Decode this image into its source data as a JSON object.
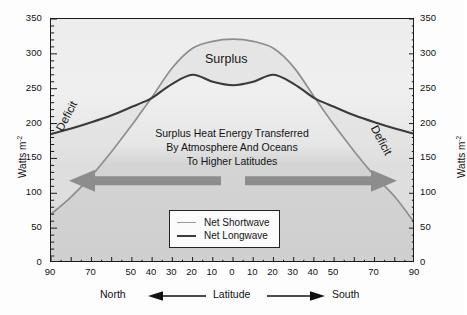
{
  "chart_data": {
    "type": "line",
    "title": "",
    "xlabel": "Latitude",
    "ylabel": "Watts m⁻²",
    "ylabel_right": "Watts m⁻²",
    "ylim": [
      0,
      350
    ],
    "yticks": [
      0,
      50,
      100,
      150,
      200,
      250,
      300,
      350
    ],
    "ytick_labels": [
      "0",
      "50",
      "100",
      "150",
      "200",
      "250",
      "300",
      "350"
    ],
    "ytick_labels_right": [
      "0",
      "50",
      "100",
      "150",
      "200",
      "250",
      "300",
      "350"
    ],
    "xlim": [
      -90,
      90
    ],
    "xticks": [
      -90,
      -70,
      -50,
      -40,
      -30,
      -20,
      -10,
      0,
      10,
      20,
      30,
      40,
      50,
      70,
      90
    ],
    "xtick_labels": [
      "90",
      "70",
      "50",
      "40",
      "30",
      "20",
      "10",
      "0",
      "10",
      "20",
      "30",
      "40",
      "50",
      "70",
      "90"
    ],
    "grid": false,
    "legend_position": "lower-center-right",
    "hemisphere_left": "North",
    "hemisphere_right": "South",
    "series": [
      {
        "name": "Net Shortwave",
        "color": "#8e8e8e",
        "x": [
          -90,
          -80,
          -70,
          -60,
          -50,
          -45,
          -40,
          -30,
          -20,
          -10,
          0,
          10,
          20,
          30,
          40,
          45,
          50,
          60,
          70,
          80,
          90
        ],
        "values": [
          70,
          95,
          125,
          160,
          198,
          218,
          238,
          280,
          308,
          318,
          321,
          318,
          308,
          281,
          239,
          218,
          198,
          160,
          125,
          95,
          57
        ]
      },
      {
        "name": "Net Longwave",
        "color": "#3a3a3a",
        "x": [
          -90,
          -80,
          -70,
          -60,
          -50,
          -45,
          -40,
          -30,
          -20,
          -10,
          0,
          10,
          20,
          30,
          40,
          45,
          50,
          60,
          70,
          80,
          90
        ],
        "values": [
          185,
          193,
          202,
          212,
          224,
          230,
          237,
          257,
          270,
          260,
          255,
          260,
          270,
          257,
          237,
          230,
          224,
          212,
          202,
          193,
          185
        ]
      }
    ],
    "annotations": [
      {
        "name": "surplus",
        "text": "Surplus"
      },
      {
        "name": "deficit-north",
        "text": "Deficit"
      },
      {
        "name": "deficit-south",
        "text": "Deficit"
      },
      {
        "name": "center-note-line1",
        "text": "Surplus Heat Energy Transferred"
      },
      {
        "name": "center-note-line2",
        "text": "By Atmosphere And Oceans"
      },
      {
        "name": "center-note-line3",
        "text": "To Higher Latitudes"
      }
    ],
    "arrows": [
      {
        "name": "transfer-arrow-left",
        "direction": "left"
      },
      {
        "name": "transfer-arrow-right",
        "direction": "right"
      }
    ]
  },
  "axes": {
    "y_title": "Watts m",
    "y_title_sup": "-2",
    "y_title_right": "Watts m",
    "y_title_right_sup": "-2"
  },
  "footer": {
    "north": "North",
    "latitude": "Latitude",
    "south": "South"
  },
  "legend": {
    "items": [
      {
        "label": "Net Shortwave",
        "key": "sw"
      },
      {
        "label": "Net Longwave",
        "key": "lw"
      }
    ]
  },
  "annot": {
    "surplus": "Surplus",
    "deficit_n": "Deficit",
    "deficit_s": "Deficit",
    "note1": "Surplus Heat Energy Transferred",
    "note2": "By Atmosphere And Oceans",
    "note3": "To Higher Latitudes"
  },
  "colors": {
    "shortwave": "#8e8e8e",
    "longwave": "#3a3a3a",
    "surplus_fill": "#e2e2e2",
    "deficit_fill": "#e8e8e8",
    "arrow": "#8d8d8d",
    "frame": "#1b1b1b"
  }
}
